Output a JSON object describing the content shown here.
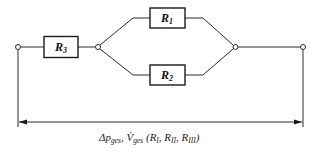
{
  "diagram": {
    "type": "resistance network (R3 in series with parallel R1 || R2)",
    "resistors": [
      {
        "id": "R1",
        "symbol": "R",
        "subscript": "1",
        "position": "upper parallel branch"
      },
      {
        "id": "R2",
        "symbol": "R",
        "subscript": "2",
        "position": "lower parallel branch"
      },
      {
        "id": "R3",
        "symbol": "R",
        "subscript": "3",
        "position": "series, left"
      }
    ],
    "dimension_label": {
      "delta_p": "Δp",
      "delta_p_sub": "ges",
      "separator": ", ",
      "flow": "V̇",
      "flow_sub": "ges",
      "open_paren": " (",
      "r_a": "R",
      "r_a_sub": "I",
      "comma_a": ", ",
      "r_b": "R",
      "r_b_sub": "II",
      "comma_b": ", ",
      "r_c": "R",
      "r_c_sub": "III",
      "close_paren": ")"
    },
    "colors": {
      "line": "#2b2b2b",
      "background": "#ffffff"
    }
  }
}
